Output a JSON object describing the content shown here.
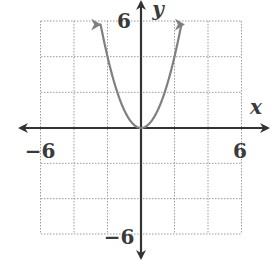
{
  "chart_data": {
    "type": "line",
    "title": "",
    "xlabel": "x",
    "ylabel": "y",
    "xlim": [
      -6,
      6
    ],
    "ylim": [
      -6,
      6
    ],
    "grid": true,
    "grid_step": 2,
    "tick_labels": {
      "x_min": "−6",
      "x_max": "6",
      "y_min": "−6",
      "y_max": "6"
    },
    "series": [
      {
        "name": "y = x^2",
        "function": "x^2",
        "color": "#808080",
        "x": [
          -2.5,
          -2,
          -1.5,
          -1,
          -0.5,
          0,
          0.5,
          1,
          1.5,
          2,
          2.5
        ],
        "values": [
          6.25,
          4,
          2.25,
          1,
          0.25,
          0,
          0.25,
          1,
          2.25,
          4,
          6.25
        ],
        "arrows_at_ends": true
      }
    ],
    "colors": {
      "axis": "#333333",
      "grid": "#9a9a9a",
      "curve": "#808080"
    }
  }
}
